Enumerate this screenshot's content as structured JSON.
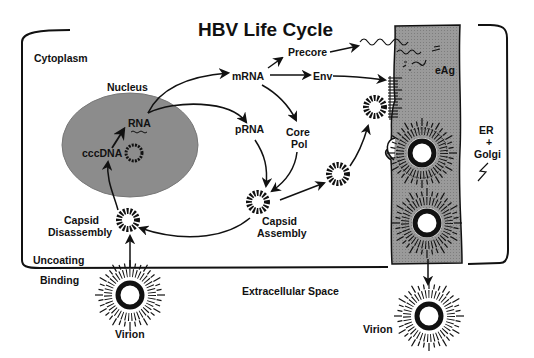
{
  "title": "HBV Life Cycle",
  "regions": {
    "cytoplasm": "Cytoplasm",
    "nucleus": "Nucleus",
    "extracellular": "Extracellular Space",
    "er_golgi": [
      "ER",
      "+",
      "Golgi"
    ]
  },
  "labels": {
    "rna": "RNA",
    "cccdna": "cccDNA",
    "mrna": "mRNA",
    "prna": "pRNA",
    "precore": "Precore",
    "env": "Env",
    "core_pol": [
      "Core",
      "Pol"
    ],
    "eag": "eAg",
    "capsid_assembly": [
      "Capsid",
      "Assembly"
    ],
    "capsid_disassembly": [
      "Capsid",
      "Disassembly"
    ],
    "uncoating": "Uncoating",
    "binding": "Binding",
    "virion_in": "Virion",
    "virion_out": "Virion"
  },
  "colors": {
    "ink": "#111111",
    "nucleus_fill": "#8c8c8c",
    "er_fill": "#9a9a9a",
    "background": "#ffffff"
  }
}
